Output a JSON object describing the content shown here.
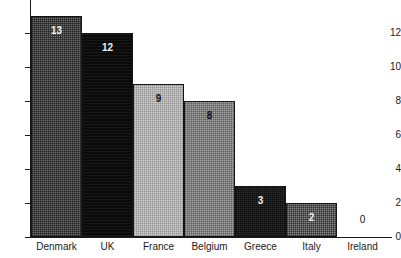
{
  "chart_data": {
    "type": "bar",
    "title": "",
    "subtitle": "",
    "xlabel": "",
    "ylabel": "",
    "categories": [
      "Denmark",
      "UK",
      "France",
      "Belgium",
      "Greece",
      "Italy",
      "Ireland"
    ],
    "values": [
      13,
      12,
      9,
      8,
      3,
      2,
      0
    ],
    "value_labels": [
      "13",
      "12",
      "9",
      "8",
      "3",
      "2",
      "0"
    ],
    "ylim": [
      0,
      13
    ],
    "ytick_labels": [
      "12",
      "10",
      "8",
      "6",
      "4",
      "2",
      "0"
    ],
    "yticks": [
      12,
      10,
      8,
      6,
      4,
      2,
      0
    ],
    "grid": false,
    "legend": "none",
    "bar_styles": [
      {
        "fill": "fill-dk",
        "label_color": "on-dark",
        "hex": "#6e6e6e"
      },
      {
        "fill": "fill-black",
        "label_color": "on-dark",
        "hex": "#0a0a0a"
      },
      {
        "fill": "fill-lt",
        "label_color": "on-light",
        "hex": "#d2d2d2"
      },
      {
        "fill": "fill-md",
        "label_color": "on-light",
        "hex": "#a8a8a8"
      },
      {
        "fill": "fill-vdk",
        "label_color": "on-dark",
        "hex": "#2e2e2e"
      },
      {
        "fill": "fill-mdk",
        "label_color": "on-dark",
        "hex": "#8a8a8a"
      },
      {
        "fill": "fill-none",
        "label_color": "on-light",
        "hex": "#ffffff"
      }
    ],
    "colors": {
      "axis": "#1a1a1a",
      "background": "#ffffff",
      "text": "#1a1a1a"
    }
  }
}
